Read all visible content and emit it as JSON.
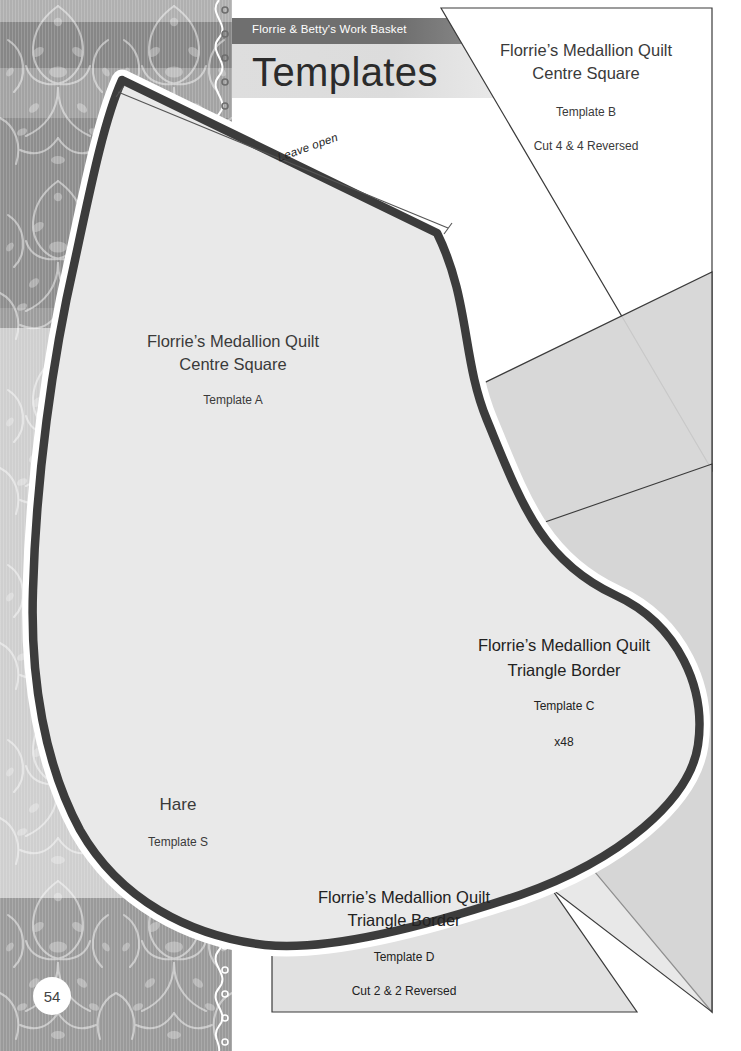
{
  "page": {
    "number": "54",
    "kicker": "Florrie & Betty's Work Basket",
    "title": "Templates",
    "background_color": "#ffffff",
    "band_color": "#b9b9b9"
  },
  "annotations": {
    "leave_open": "Leave open"
  },
  "templates": [
    {
      "id": "template-a",
      "quilt_name": "Florrie’s Medallion Quilt",
      "part_name": "Centre Square",
      "label": "Template A",
      "quantity": "",
      "shape": "quadrilateral",
      "fill": "#ffffff"
    },
    {
      "id": "template-b",
      "quilt_name": "Florrie’s Medallion Quilt",
      "part_name": "Centre Square",
      "label": "Template B",
      "quantity": "Cut 4 & 4 Reversed",
      "shape": "triangle",
      "fill": "#ffffff"
    },
    {
      "id": "template-c",
      "quilt_name": "Florrie’s Medallion Quilt",
      "part_name": "Triangle Border",
      "label": "Template C",
      "quantity": "x48",
      "shape": "triangle",
      "fill": "#d9d9d9"
    },
    {
      "id": "template-d",
      "quilt_name": "Florrie’s Medallion Quilt",
      "part_name": "Triangle Border",
      "label": "Template D",
      "quantity": "Cut 2 & 2 Reversed",
      "shape": "triangle",
      "fill": "#d9d9d9"
    },
    {
      "id": "template-s",
      "quilt_name": "Hare",
      "part_name": "",
      "label": "Template S",
      "quantity": "",
      "shape": "hare-silhouette",
      "fill": "#d7d7d7"
    }
  ]
}
